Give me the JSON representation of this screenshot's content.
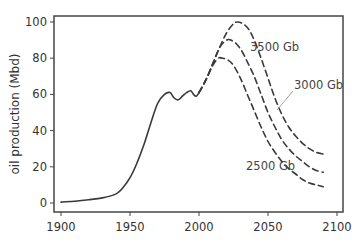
{
  "chart_data": {
    "type": "line",
    "title": "",
    "xlabel": "",
    "ylabel": "oil production (Mbd)",
    "xlim": [
      1895,
      2104
    ],
    "ylim": [
      -2,
      102
    ],
    "xticks": [
      1900,
      1950,
      2000,
      2050,
      2100
    ],
    "yticks": [
      0,
      20,
      40,
      60,
      80,
      100
    ],
    "grid": false,
    "legend": null,
    "series": [
      {
        "name": "historical",
        "style": "solid",
        "x": [
          1900,
          1910,
          1920,
          1930,
          1940,
          1945,
          1950,
          1955,
          1960,
          1965,
          1970,
          1975,
          1979,
          1982,
          1985,
          1988,
          1991,
          1994,
          1996,
          1998,
          2000
        ],
        "y": [
          0.5,
          1,
          1.8,
          2.8,
          5,
          8.5,
          14,
          22,
          32,
          44,
          55,
          60,
          61,
          58,
          57,
          59,
          61,
          62,
          60,
          59,
          61
        ]
      },
      {
        "name": "3500 Gb",
        "style": "dashed",
        "x": [
          2000,
          2005,
          2010,
          2015,
          2020,
          2025,
          2028,
          2032,
          2036,
          2040,
          2045,
          2050,
          2055,
          2060,
          2065,
          2070,
          2075,
          2080,
          2085,
          2090
        ],
        "y": [
          61,
          68,
          77,
          86,
          94,
          99,
          100,
          99,
          96,
          90,
          80,
          69,
          58,
          49,
          42,
          37,
          33,
          30,
          28,
          27
        ]
      },
      {
        "name": "3000 Gb",
        "style": "dashed",
        "x": [
          2000,
          2005,
          2010,
          2015,
          2020,
          2023,
          2027,
          2031,
          2035,
          2040,
          2045,
          2050,
          2055,
          2060,
          2065,
          2070,
          2075,
          2080,
          2085,
          2090
        ],
        "y": [
          61,
          68,
          77,
          86,
          90,
          90,
          88,
          84,
          78,
          70,
          60,
          50,
          42,
          35,
          30,
          26,
          23,
          20,
          18,
          17
        ]
      },
      {
        "name": "2500 Gb",
        "style": "dashed",
        "x": [
          2000,
          2005,
          2010,
          2014,
          2017,
          2021,
          2025,
          2030,
          2035,
          2040,
          2045,
          2050,
          2055,
          2060,
          2065,
          2070,
          2075,
          2080,
          2085,
          2090
        ],
        "y": [
          61,
          68,
          76,
          80,
          80,
          79,
          76,
          69,
          60,
          51,
          42,
          34,
          28,
          23,
          19,
          16,
          13,
          11,
          10,
          9
        ]
      }
    ],
    "annotations": [
      {
        "text": "3500 Gb",
        "x": 2040,
        "y": 89
      },
      {
        "text": "3000 Gb",
        "x": 2061,
        "y": 66,
        "leader_line": true
      },
      {
        "text": "2500 Gb",
        "x": 2025,
        "y": 19
      }
    ]
  },
  "labels": {
    "ylabel": "oil production (Mbd)",
    "xticks": [
      "1900",
      "1950",
      "2000",
      "2050",
      "2100"
    ],
    "yticks": [
      "0",
      "20",
      "40",
      "60",
      "80",
      "100"
    ],
    "annot_3500": "3500 Gb",
    "annot_3000": "3000 Gb",
    "annot_2500": "2500 Gb"
  }
}
